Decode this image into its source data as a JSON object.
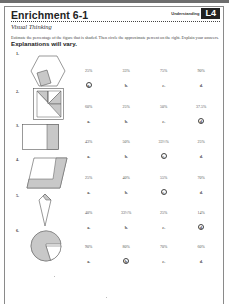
{
  "header": {
    "title": "Enrichment 6-1",
    "badge_label": "Understanding",
    "badge": "L4",
    "subtitle": "Visual Thinking",
    "instructions": "Estimate the percentage of the figure that is shaded. Then circle the approximate percent on the right. Explain your answers.",
    "instructions_emphasis": "Explanations will vary."
  },
  "colors": {
    "shade": "#c8c8c8",
    "stroke": "#555555",
    "badge_bg": "#222222"
  },
  "questions": [
    {
      "number": "1.",
      "figure": "hexagon-with-shaded-square",
      "options": [
        {
          "value": "25%",
          "letter": "a."
        },
        {
          "value": "33%",
          "letter": "b."
        },
        {
          "value": "75%",
          "letter": "c."
        },
        {
          "value": "90%",
          "letter": "d."
        }
      ],
      "answer_index": 0
    },
    {
      "number": "2.",
      "figure": "square-with-shaded-triangles",
      "options": [
        {
          "value": "60%",
          "letter": "a."
        },
        {
          "value": "25%",
          "letter": "b."
        },
        {
          "value": "50%",
          "letter": "c."
        },
        {
          "value": "37.5%",
          "letter": "d."
        }
      ],
      "answer_index": 3
    },
    {
      "number": "3.",
      "figure": "rectangle-with-shaded-strip",
      "options": [
        {
          "value": "43%",
          "letter": "a."
        },
        {
          "value": "50%",
          "letter": "b."
        },
        {
          "value": "33⅓%",
          "letter": "c."
        },
        {
          "value": "25%",
          "letter": "d."
        }
      ],
      "answer_index": 2
    },
    {
      "number": "4.",
      "figure": "parallelogram-with-shaded-L",
      "options": [
        {
          "value": "25%",
          "letter": "a."
        },
        {
          "value": "40%",
          "letter": "b."
        },
        {
          "value": "55%",
          "letter": "c."
        },
        {
          "value": "70%",
          "letter": "d."
        }
      ],
      "answer_index": 2
    },
    {
      "number": "5.",
      "figure": "kite-with-shaded-tip",
      "options": [
        {
          "value": "40%",
          "letter": "a."
        },
        {
          "value": "33⅓%",
          "letter": "b."
        },
        {
          "value": "25%",
          "letter": "c."
        },
        {
          "value": "14%",
          "letter": "d."
        }
      ],
      "answer_index": 3
    },
    {
      "number": "6.",
      "figure": "circle-with-shaded-sector",
      "options": [
        {
          "value": "90%",
          "letter": "a."
        },
        {
          "value": "80%",
          "letter": "b."
        },
        {
          "value": "70%",
          "letter": "c."
        },
        {
          "value": "60%",
          "letter": "d."
        }
      ],
      "answer_index": 1
    }
  ]
}
